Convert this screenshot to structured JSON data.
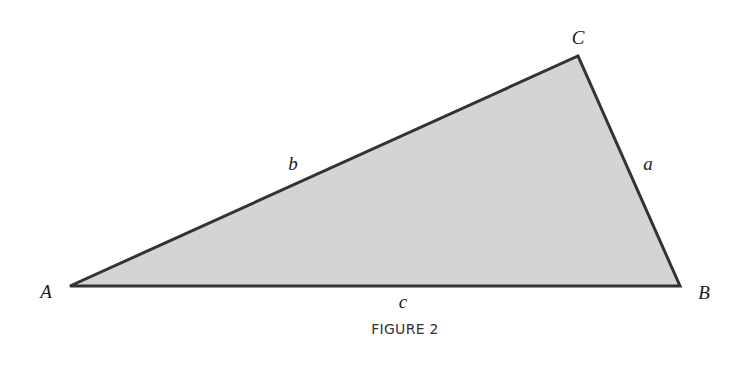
{
  "figure": {
    "caption": "FIGURE 2",
    "fill_color": "#d4d4d4",
    "stroke_color": "#333333",
    "vertices": [
      {
        "label": "A",
        "x": 70,
        "y": 286,
        "label_x": 46,
        "label_y": 298
      },
      {
        "label": "B",
        "x": 680,
        "y": 286,
        "label_x": 704,
        "label_y": 299
      },
      {
        "label": "C",
        "x": 578,
        "y": 56,
        "label_x": 578,
        "label_y": 44
      }
    ],
    "sides": [
      {
        "label": "a",
        "label_x": 648,
        "label_y": 170
      },
      {
        "label": "b",
        "label_x": 293,
        "label_y": 170
      },
      {
        "label": "c",
        "label_x": 403,
        "label_y": 308
      }
    ]
  }
}
